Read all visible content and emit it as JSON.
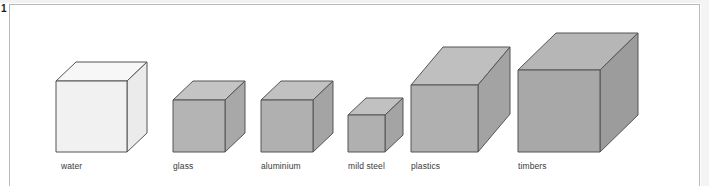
{
  "figure": {
    "number": "1",
    "caption_labels_present": true
  },
  "frame": {
    "border_color": "#b9b9b9",
    "background": "#ffffff"
  },
  "chart_data": {
    "type": "bar",
    "title": "",
    "subtitle": "",
    "xlabel": "",
    "ylabel": "",
    "categories": [
      "water",
      "glass",
      "aluminium",
      "mild steel",
      "plastics",
      "timbers"
    ],
    "values": [
      71,
      52,
      52,
      37,
      67,
      82
    ],
    "value_units": "px cube edge (relative volume for equal mass)",
    "grid": false,
    "legend": "none",
    "annotations": []
  },
  "cubes": [
    {
      "name": "water",
      "label": "water",
      "front_fill": "#f1f1f1",
      "top_fill": "#f7f7f7",
      "side_fill": "#ebebeb",
      "stroke": "#555555",
      "front_x": 56,
      "front_y": 81,
      "edge": 71,
      "depth_x": 20,
      "depth_y": -19,
      "label_x": 61,
      "label_y": 161
    },
    {
      "name": "glass",
      "label": "glass",
      "front_fill": "#b4b4b4",
      "top_fill": "#c4c4c4",
      "side_fill": "#a8a8a8",
      "stroke": "#555555",
      "front_x": 173,
      "front_y": 100,
      "edge": 52,
      "depth_x": 20,
      "depth_y": -19,
      "label_x": 173,
      "label_y": 161
    },
    {
      "name": "aluminium",
      "label": "aluminium",
      "front_fill": "#b0b0b0",
      "top_fill": "#c1c1c1",
      "side_fill": "#a4a4a4",
      "stroke": "#555555",
      "front_x": 261,
      "front_y": 100,
      "edge": 52,
      "depth_x": 20,
      "depth_y": -19,
      "label_x": 261,
      "label_y": 161
    },
    {
      "name": "mild-steel",
      "label": "mild steel",
      "front_fill": "#b0b0b0",
      "top_fill": "#c1c1c1",
      "side_fill": "#a4a4a4",
      "stroke": "#555555",
      "front_x": 348,
      "front_y": 115,
      "edge": 37,
      "depth_x": 18,
      "depth_y": -17,
      "label_x": 348,
      "label_y": 161
    },
    {
      "name": "plastics",
      "label": "plastics",
      "front_fill": "#b0b0b0",
      "top_fill": "#bfbfbf",
      "side_fill": "#a3a3a3",
      "stroke": "#555555",
      "front_x": 411,
      "front_y": 85,
      "edge": 67,
      "depth_x": 32,
      "depth_y": -38,
      "label_x": 411,
      "label_y": 161
    },
    {
      "name": "timbers",
      "label": "timbers",
      "front_fill": "#a8a8a8",
      "top_fill": "#b6b6b6",
      "side_fill": "#9c9c9c",
      "stroke": "#555555",
      "front_x": 518,
      "front_y": 70,
      "edge": 82,
      "depth_x": 38,
      "depth_y": -37,
      "label_x": 518,
      "label_y": 161
    }
  ],
  "colors": {
    "frame_border": "#b9b9b9",
    "label_text": "#3a3a3a",
    "figure_number": "#1a1a1a",
    "page_gutter": "#f2f2f2"
  }
}
